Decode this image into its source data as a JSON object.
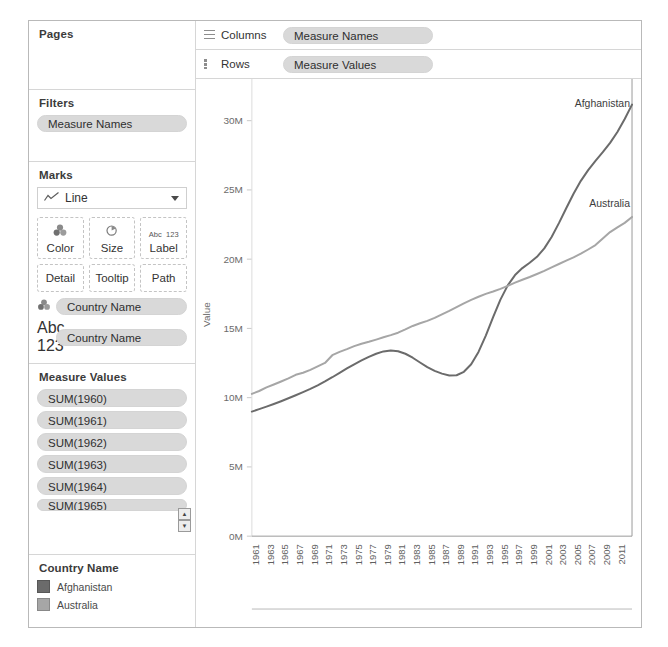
{
  "left_panel": {
    "pages": {
      "title": "Pages"
    },
    "filters": {
      "title": "Filters",
      "items": [
        "Measure Names"
      ]
    },
    "marks": {
      "title": "Marks",
      "type_label": "Line",
      "type_icon": "line-chart-icon",
      "buttons": [
        {
          "label": "Color",
          "icon": "color-palette-icon"
        },
        {
          "label": "Size",
          "icon": "size-circle-icon"
        },
        {
          "label": "Label",
          "icon": "abc-123-icon",
          "icon_text_top": "Abc",
          "icon_text_bottom": "123"
        },
        {
          "label": "Detail",
          "icon": "detail-icon"
        },
        {
          "label": "Tooltip",
          "icon": "tooltip-icon"
        },
        {
          "label": "Path",
          "icon": "path-icon"
        }
      ],
      "fields": [
        {
          "label": "Country Name",
          "icon": "color-palette-icon"
        },
        {
          "label": "Country Name",
          "icon": "abc-123-icon",
          "icon_text_top": "Abc",
          "icon_text_bottom": "123"
        }
      ]
    },
    "measure_values": {
      "title": "Measure Values",
      "items": [
        "SUM(1960)",
        "SUM(1961)",
        "SUM(1962)",
        "SUM(1963)",
        "SUM(1964)",
        "SUM(1965)"
      ],
      "scroll_up": "▲",
      "scroll_down": "▼"
    },
    "legend": {
      "title": "Country Name",
      "entries": [
        {
          "label": "Afghanistan",
          "color": "#6b6b6b"
        },
        {
          "label": "Australia",
          "color": "#a6a6a6"
        }
      ]
    }
  },
  "shelves": {
    "columns": {
      "name": "Columns",
      "icon": "columns-grid-icon",
      "pill": "Measure Names"
    },
    "rows": {
      "name": "Rows",
      "icon": "rows-grid-icon",
      "pill": "Measure Values"
    }
  },
  "chart_data": {
    "type": "line",
    "title": "",
    "xlabel": "",
    "ylabel": "Value",
    "ylim": [
      0,
      32000000
    ],
    "xlim": [
      1960,
      2012
    ],
    "grid": false,
    "legend_position": "external-left-panel",
    "y_ticks": [
      0,
      5000000,
      10000000,
      15000000,
      20000000,
      25000000,
      30000000
    ],
    "y_tick_labels": [
      "0M",
      "5M",
      "10M",
      "15M",
      "20M",
      "25M",
      "30M"
    ],
    "x_tick_labels": [
      "1961",
      "1963",
      "1965",
      "1967",
      "1969",
      "1971",
      "1973",
      "1975",
      "1977",
      "1979",
      "1981",
      "1983",
      "1985",
      "1987",
      "1989",
      "1991",
      "1993",
      "1995",
      "1997",
      "1999",
      "2001",
      "2003",
      "2005",
      "2007",
      "2009",
      "2011"
    ],
    "annotations": [
      {
        "text": "Afghanistan",
        "series": "Afghanistan",
        "x": 2012,
        "y": 31000000
      },
      {
        "text": "Australia",
        "series": "Australia",
        "x": 2012,
        "y": 23800000
      }
    ],
    "x": [
      1960,
      1961,
      1962,
      1963,
      1964,
      1965,
      1966,
      1967,
      1968,
      1969,
      1970,
      1971,
      1972,
      1973,
      1974,
      1975,
      1976,
      1977,
      1978,
      1979,
      1980,
      1981,
      1982,
      1983,
      1984,
      1985,
      1986,
      1987,
      1988,
      1989,
      1990,
      1991,
      1992,
      1993,
      1994,
      1995,
      1996,
      1997,
      1998,
      1999,
      2000,
      2001,
      2002,
      2003,
      2004,
      2005,
      2006,
      2007,
      2008,
      2009,
      2010,
      2011,
      2012
    ],
    "series": [
      {
        "name": "Afghanistan",
        "color": "#6b6b6b",
        "values": [
          8996000,
          9170000,
          9351000,
          9543000,
          9745000,
          9956000,
          10175000,
          10400000,
          10637000,
          10894000,
          11174000,
          11475000,
          11792000,
          12109000,
          12412000,
          12689000,
          12944000,
          13172000,
          13341000,
          13411000,
          13356000,
          13171000,
          12883000,
          12537000,
          12204000,
          11938000,
          11736000,
          11604000,
          11618000,
          11868000,
          12412000,
          13300000,
          14486000,
          15817000,
          17076000,
          18111000,
          18853000,
          19357000,
          19737000,
          20170000,
          20779000,
          21607000,
          22601000,
          23681000,
          24727000,
          25654000,
          26433000,
          27100000,
          27722000,
          28394000,
          29186000,
          30117000,
          31161000
        ]
      },
      {
        "name": "Australia",
        "color": "#a6a6a6",
        "values": [
          10276000,
          10483000,
          10742000,
          10950000,
          11167000,
          11388000,
          11651000,
          11799000,
          12009000,
          12263000,
          12507000,
          13067000,
          13304000,
          13505000,
          13723000,
          13893000,
          14033000,
          14192000,
          14358000,
          14514000,
          14692000,
          14927000,
          15178000,
          15369000,
          15544000,
          15758000,
          16018000,
          16264000,
          16532000,
          16814000,
          17065000,
          17284000,
          17495000,
          17667000,
          17855000,
          18072000,
          18311000,
          18517000,
          18711000,
          18926000,
          19153000,
          19413000,
          19651000,
          19895000,
          20127000,
          20395000,
          20698000,
          21016000,
          21499000,
          21955000,
          22299000,
          22620000,
          23050000
        ]
      }
    ]
  }
}
